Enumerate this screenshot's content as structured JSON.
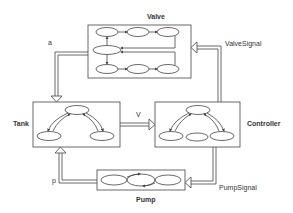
{
  "diagram": {
    "components": {
      "valve": {
        "label": "Valve"
      },
      "tank": {
        "label": "Tank"
      },
      "controller": {
        "label": "Controller"
      },
      "pump": {
        "label": "Pump"
      }
    },
    "signals": {
      "a": "a",
      "v": "V",
      "p": "p",
      "valve_signal": "ValveSignal",
      "pump_signal": "PumpSignal"
    },
    "colors": {
      "stroke": "#444444",
      "background": "#ffffff"
    }
  }
}
